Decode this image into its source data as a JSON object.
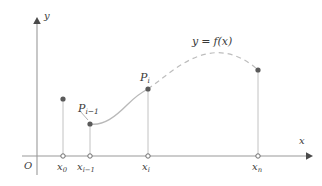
{
  "figure": {
    "kind": "calculus-partition-diagram",
    "width": 322,
    "height": 186,
    "background_color": "#ffffff",
    "stroke_color": "#9a9a9a",
    "curve_color": "#b4b4b4",
    "text_color": "#3a3a3a",
    "marker_fill": "#5a5a5a"
  },
  "axes": {
    "x_label": "x",
    "y_label": "y",
    "origin_label": "O",
    "x_axis_start_px": 22,
    "x_axis_end_px": 312,
    "y_axis_px": 37,
    "baseline_px": 156,
    "y_axis_top_px": 18
  },
  "ticks": [
    {
      "id": "x0",
      "label_main": "x",
      "label_sub": "0",
      "x_px": 63
    },
    {
      "id": "xim1",
      "label_main": "x",
      "label_sub": "i−1",
      "x_px": 90
    },
    {
      "id": "xi",
      "label_main": "x",
      "label_sub": "i",
      "x_px": 148
    },
    {
      "id": "xn",
      "label_main": "x",
      "label_sub": "n",
      "x_px": 258
    }
  ],
  "points": [
    {
      "id": "p-x0",
      "x_px": 63,
      "y_px": 99,
      "labeled": false
    },
    {
      "id": "p-im1",
      "x_px": 90,
      "y_px": 124,
      "labeled": true,
      "label_main": "P",
      "label_sub": "i−1"
    },
    {
      "id": "p-i",
      "x_px": 148,
      "y_px": 89,
      "labeled": true,
      "label_main": "P",
      "label_sub": "i"
    },
    {
      "id": "p-xn",
      "x_px": 258,
      "y_px": 70,
      "labeled": false
    }
  ],
  "curve": {
    "equation_main": "y = f(x)",
    "equation_lhs": "y",
    "equation_eq": "=",
    "equation_rhs_fn": "f",
    "equation_rhs_arg": "(x)",
    "solid_segment": "from P(i-1) to P(i)",
    "dashed_segment": "from P(i) through peak to point at x_n",
    "dash_pattern": "5 4"
  },
  "labels": {
    "curve_equation_x_px": 192,
    "curve_equation_y_px": 36,
    "p_im1_x_px": 78,
    "p_im1_y_px": 103,
    "p_i_x_px": 140,
    "p_i_y_px": 72
  }
}
